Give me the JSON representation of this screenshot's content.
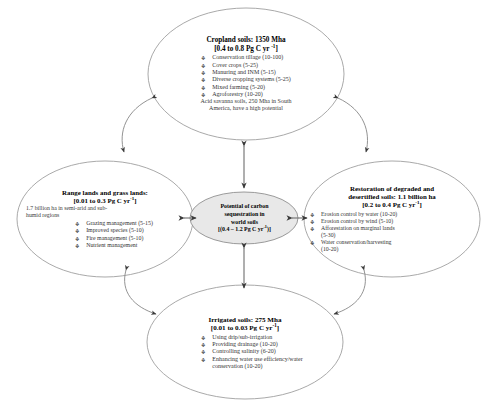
{
  "diagram": {
    "title": "Potential of carbon sequestration in world soils",
    "type": "concept-hub-and-spoke",
    "colors": {
      "ellipse_stroke": "#8a8a8a",
      "center_fill": "#e8e8e8",
      "arrow": "#555555",
      "text": "#1a1a1a",
      "background": "#ffffff"
    }
  },
  "center": {
    "line1": "Potential of carbon",
    "line2": "sequestration in",
    "line3": "world soils",
    "line4_pre": "[(0.4 – 1.2 Pg C yr",
    "line4_sup": "-1",
    "line4_post": ")]"
  },
  "cropland": {
    "title": "Cropland soils: 1350 Mha",
    "rate_pre": "[0.4 to 0.8 Pg C yr ",
    "rate_sup": "-1",
    "rate_post": "]",
    "bullets": [
      "Conservation tillage (10-100)",
      "Cover crops (5-25)",
      "Manuring and INM (5-15)",
      "Diverse cropping systems (5-25)",
      "Mixed farming (5-20)",
      "Agroforestry (10-20)"
    ],
    "note_line1": "Acid savanna soils, 250 Mha in South",
    "note_line2": "America, have a high potential"
  },
  "range": {
    "title": "Range lands and grass lands:",
    "rate_pre": "[0.01 to 0.3 Pg C yr",
    "rate_sup": "-1",
    "rate_post": "]",
    "note_line1": "1.7 billion ha in semi-arid and sub-",
    "note_line2": "humid regions",
    "bullets": [
      "Grazing management (5-15)",
      "Improved species (5-10)",
      "Fire management (5-10)",
      "Nutrient management"
    ]
  },
  "restoration": {
    "title_line1": "Restoration of degraded and",
    "title_line2": "desertified soils: 1.1 billion ha",
    "rate_pre": "[0.2 to 0.4 Pg C  yr",
    "rate_sup": "-1",
    "rate_post": "]",
    "bullets": [
      "Erosion control by water (10-20)",
      "Erosion control by wind (5-10)",
      "Afforestation on marginal lands",
      "(5-30)",
      "Water conservation/harvesting",
      "(10-20)"
    ]
  },
  "irrigated": {
    "title": "Irrigated soils: 275 Mha",
    "rate_pre": "[0.01 to 0.03 Pg C yr",
    "rate_sup": "-1",
    "rate_post": "]",
    "bullets": [
      "Using drip/sub-irrigation",
      "Providing drainage (10-20)",
      "Controlling salinity (6-20)",
      "Enhancing water use efficiency/water",
      "conservation (10-20)"
    ]
  }
}
